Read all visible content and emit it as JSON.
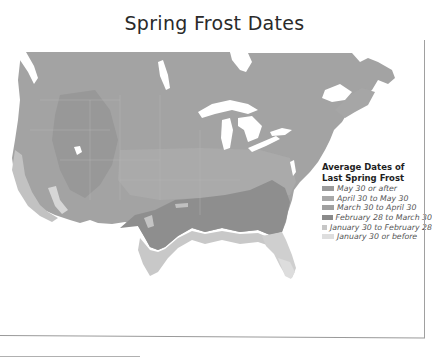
{
  "title": "Spring Frost Dates",
  "map": {
    "region": "United States and southern Canada",
    "colors": {
      "may30_or_after": "#9c9c9c",
      "april30_to_may30": "#a9a9a9",
      "march30_to_april30": "#a2a2a2",
      "feb28_to_march30": "#8f8f8f",
      "jan30_to_feb28": "#c4c4c4",
      "jan30_or_before": "#dcdcdc",
      "water": "#ffffff"
    }
  },
  "legend": {
    "title_line1": "Average Dates of",
    "title_line2": "Last Spring Frost",
    "items": [
      {
        "label": "May 30 or after",
        "color": "#9a9a9a"
      },
      {
        "label": "April 30 to May 30",
        "color": "#a8a8a8"
      },
      {
        "label": "March 30 to April 30",
        "color": "#a0a0a0"
      },
      {
        "label": "February 28 to March 30",
        "color": "#8a8a8a"
      },
      {
        "label": "January 30 to February 28",
        "color": "#c6c6c6"
      },
      {
        "label": "January 30 or before",
        "color": "#dedede"
      }
    ]
  }
}
